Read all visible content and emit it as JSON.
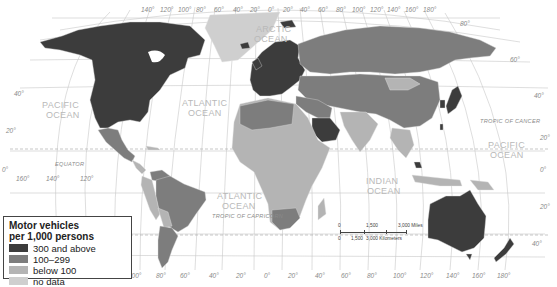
{
  "legend": {
    "title_line1": "Motor vehicles",
    "title_line2": "per 1,000 persons",
    "items": [
      {
        "label": "300 and above",
        "color": "#3c3c3c"
      },
      {
        "label": "100–299",
        "color": "#7d7d7d"
      },
      {
        "label": "below 100",
        "color": "#b4b4b4"
      },
      {
        "label": "no data",
        "color": "#cfcfcf"
      }
    ]
  },
  "oceans": {
    "pacific_left_1": "PACIFIC",
    "pacific_left_2": "OCEAN",
    "atlantic_north_1": "ATLANTIC",
    "atlantic_north_2": "OCEAN",
    "arctic_1": "ARCTIC",
    "arctic_2": "OCEAN",
    "atlantic_south_1": "ATLANTIC",
    "atlantic_south_2": "OCEAN",
    "indian_1": "INDIAN",
    "indian_2": "OCEAN",
    "pacific_right_1": "PACIFIC",
    "pacific_right_2": "OCEAN"
  },
  "lines": {
    "equator": "EQUATOR",
    "tropic_cancer": "TROPIC OF CANCER",
    "tropic_capricorn": "TROPIC OF CAPRICORN"
  },
  "graticule": {
    "top_longitudes": [
      "140°",
      "120°",
      "100°",
      "80°",
      "60°",
      "40°",
      "20°",
      "0°",
      "20°",
      "40°",
      "60°",
      "80°",
      "100°",
      "120°",
      "140°",
      "160°",
      "180°"
    ],
    "bottom_longitudes": [
      "100°",
      "80°",
      "60°",
      "40°",
      "20°",
      "0°",
      "20°",
      "40°",
      "60°",
      "80°",
      "100°",
      "120°",
      "140°",
      "160°",
      "180°"
    ],
    "left_latitudes": [
      "40°",
      "20°",
      "0°",
      "20°",
      "40°"
    ],
    "right_latitudes": [
      "80°",
      "60°",
      "40°",
      "20°",
      "0°",
      "20°",
      "40°"
    ],
    "equator_longitudes": [
      "160°",
      "140°",
      "120°"
    ]
  },
  "scale": {
    "miles_0": "0",
    "miles_mid": "1,500",
    "miles_end": "3,000 Miles",
    "km_0": "0",
    "km_mid": "1,500",
    "km_end": "3,000 Kilometers"
  }
}
